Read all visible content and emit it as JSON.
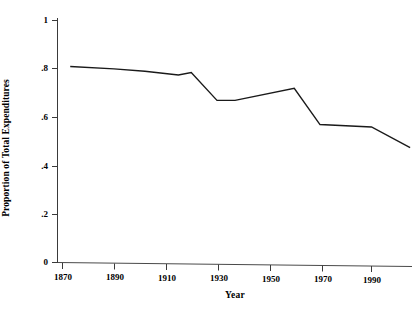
{
  "chart_data": {
    "type": "line",
    "title": "",
    "xlabel": "Year",
    "ylabel": "Proportion of Total Expenditures",
    "xlim": [
      1865,
      2008
    ],
    "ylim": [
      0,
      1.05
    ],
    "grid": false,
    "legend": null,
    "x_ticks": [
      1870,
      1890,
      1910,
      1930,
      1950,
      1970,
      1990
    ],
    "x_tick_labels": [
      "1870",
      "1890",
      "1910",
      "1930",
      "1950",
      "1970",
      "1990"
    ],
    "y_ticks": [
      0,
      0.2,
      0.4,
      0.6,
      0.8,
      1
    ],
    "y_tick_labels": [
      "0",
      ".2",
      ".4",
      ".6",
      ".8",
      "1"
    ],
    "line_color": "#1a1a1a",
    "x": [
      1873,
      1890,
      1902,
      1915,
      1920,
      1930,
      1937,
      1960,
      1970,
      1990,
      2005
    ],
    "y": [
      0.81,
      0.8,
      0.79,
      0.775,
      0.785,
      0.67,
      0.67,
      0.72,
      0.57,
      0.56,
      0.475
    ],
    "series": [
      {
        "name": "Proportion of Total Expenditures",
        "points": [
          {
            "x": 1873,
            "y": 0.81
          },
          {
            "x": 1890,
            "y": 0.8
          },
          {
            "x": 1902,
            "y": 0.79
          },
          {
            "x": 1915,
            "y": 0.775
          },
          {
            "x": 1920,
            "y": 0.785
          },
          {
            "x": 1930,
            "y": 0.67
          },
          {
            "x": 1937,
            "y": 0.67
          },
          {
            "x": 1960,
            "y": 0.72
          },
          {
            "x": 1970,
            "y": 0.57
          },
          {
            "x": 1990,
            "y": 0.56
          },
          {
            "x": 2005,
            "y": 0.475
          }
        ]
      }
    ]
  },
  "axis": {
    "x_label": "Year",
    "y_label": "Proportion of Total Expenditures"
  },
  "ticks": {
    "y": [
      {
        "label": "1",
        "top": 20
      },
      {
        "label": ".8",
        "top": 68
      },
      {
        "label": ".6",
        "top": 117
      },
      {
        "label": ".4",
        "top": 166
      },
      {
        "label": ".2",
        "top": 214
      },
      {
        "label": "0",
        "top": 262
      }
    ],
    "x": [
      {
        "label": "1870",
        "left": 62
      },
      {
        "label": "1890",
        "left": 114
      },
      {
        "label": "1910",
        "left": 166
      },
      {
        "label": "1930",
        "left": 218
      },
      {
        "label": "1950",
        "left": 270
      },
      {
        "label": "1970",
        "left": 322
      },
      {
        "label": "1990",
        "left": 371
      }
    ]
  }
}
